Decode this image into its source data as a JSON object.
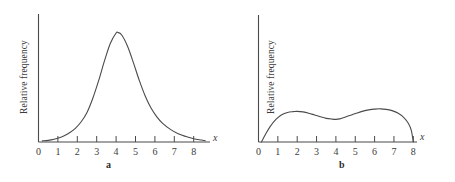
{
  "figure": {
    "background": "#ffffff",
    "stroke_color": "#4a4a4a",
    "text_color": "#3b3b3b"
  },
  "chart_data": [
    {
      "type": "line",
      "panel": "a",
      "caption": "a",
      "title": "",
      "xlabel": "x",
      "ylabel": "Relative frequency",
      "xlim": [
        0,
        8.6
      ],
      "ylim": [
        0,
        1.05
      ],
      "grid": false,
      "legend": "none",
      "xticks": [
        0,
        1,
        2,
        3,
        4,
        5,
        6,
        7,
        8
      ],
      "xtick_labels": [
        "0",
        "1",
        "2",
        "3",
        "4",
        "5",
        "6",
        "7",
        "8"
      ],
      "yticks": [],
      "ytick_labels": [],
      "shape": "unimodal symmetric bell curve peaked near x = 4.1 with long thin tails",
      "x": [
        0.2,
        0.5,
        0.8,
        1.0,
        1.3,
        1.6,
        1.9,
        2.2,
        2.5,
        2.8,
        3.1,
        3.4,
        3.7,
        4.0,
        4.1,
        4.3,
        4.6,
        4.9,
        5.2,
        5.5,
        5.8,
        6.1,
        6.4,
        6.8,
        7.2,
        7.6,
        8.0,
        8.4,
        8.6
      ],
      "y": [
        0.01,
        0.015,
        0.025,
        0.035,
        0.055,
        0.085,
        0.125,
        0.185,
        0.27,
        0.4,
        0.56,
        0.74,
        0.9,
        0.995,
        1.0,
        0.975,
        0.87,
        0.72,
        0.56,
        0.42,
        0.31,
        0.23,
        0.17,
        0.115,
        0.075,
        0.05,
        0.03,
        0.018,
        0.012
      ]
    },
    {
      "type": "line",
      "panel": "b",
      "caption": "b",
      "title": "",
      "xlabel": "x",
      "ylabel": "Relative frequency",
      "xlim": [
        0,
        8.6
      ],
      "ylim": [
        0,
        1.05
      ],
      "grid": false,
      "legend": "none",
      "xticks": [
        0,
        1,
        2,
        3,
        4,
        5,
        6,
        7,
        8
      ],
      "xtick_labels": [
        "0",
        "1",
        "2",
        "3",
        "4",
        "5",
        "6",
        "7",
        "8"
      ],
      "yticks": [],
      "ytick_labels": [],
      "shape": "bimodal curve rising from zero at x = 0.15, modes near x = 2.0 and x = 6.3, local dip near x = 4.0, falling to zero at x = 8.0",
      "x": [
        0.15,
        0.35,
        0.6,
        0.9,
        1.2,
        1.5,
        1.8,
        2.0,
        2.3,
        2.6,
        2.9,
        3.2,
        3.5,
        3.8,
        4.0,
        4.2,
        4.5,
        4.8,
        5.1,
        5.4,
        5.7,
        6.0,
        6.3,
        6.6,
        6.9,
        7.2,
        7.5,
        7.75,
        7.9,
        8.0
      ],
      "y": [
        0.0,
        0.14,
        0.3,
        0.44,
        0.53,
        0.575,
        0.59,
        0.595,
        0.585,
        0.56,
        0.525,
        0.49,
        0.46,
        0.445,
        0.44,
        0.45,
        0.485,
        0.525,
        0.565,
        0.6,
        0.625,
        0.64,
        0.645,
        0.635,
        0.61,
        0.565,
        0.48,
        0.36,
        0.22,
        0.0
      ]
    }
  ],
  "panels": {
    "a": {
      "caption": "a",
      "ylabel": "Relative frequency",
      "xlabel": "x",
      "xtick_labels": [
        "0",
        "1",
        "2",
        "3",
        "4",
        "5",
        "6",
        "7",
        "8"
      ]
    },
    "b": {
      "caption": "b",
      "ylabel": "Relative frequency",
      "xlabel": "x",
      "xtick_labels": [
        "0",
        "1",
        "2",
        "3",
        "4",
        "5",
        "6",
        "7",
        "8"
      ]
    }
  }
}
